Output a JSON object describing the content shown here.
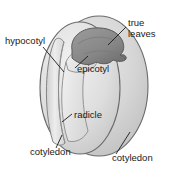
{
  "figure": {
    "background_color": "#ffffff",
    "line_color": "#1a1a1a",
    "text_color": "#1a1a1a",
    "seed_fill_far": "#cfcfcf",
    "seed_fill_near": "#dcdcdc",
    "seed_fill_highlight": "#ebebeb",
    "true_leaves_fill": "#8e8e8e",
    "true_leaves_fill_dark": "#6f6f6f",
    "epicotyl_fill": "#e6e6e6",
    "hypocotyl_fill": "#e2e2e2"
  },
  "labels": {
    "hypocotyl": "hypocotyl",
    "true_leaves_line1": "true",
    "true_leaves_line2": "leaves",
    "epicotyl": "epicotyl",
    "radicle": "radicle",
    "cotyledon_left": "cotyledon",
    "cotyledon_right": "cotyledon"
  }
}
